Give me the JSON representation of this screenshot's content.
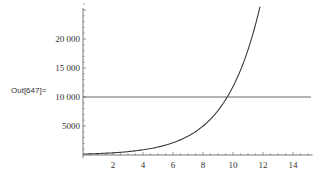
{
  "cell": {
    "output_label": "Out[647]="
  },
  "chart_data": {
    "type": "line",
    "title": "",
    "xlabel": "",
    "ylabel": "",
    "xlim": [
      0,
      15.3
    ],
    "ylim": [
      0,
      25500
    ],
    "grid": false,
    "x_ticks": [
      2,
      4,
      6,
      8,
      10,
      12,
      14
    ],
    "x_tick_labels": [
      "2",
      "4",
      "6",
      "8",
      "10",
      "12",
      "14"
    ],
    "y_ticks": [
      5000,
      10000,
      15000,
      20000
    ],
    "y_tick_labels": [
      "5000",
      "10 000",
      "15 000",
      "20 000"
    ],
    "series": [
      {
        "name": "exponential curve",
        "x": [
          0,
          1,
          2,
          3,
          4,
          5,
          6,
          7,
          8,
          9,
          10,
          11,
          11.8
        ],
        "values": [
          160,
          246,
          378,
          580,
          892,
          1370,
          2110,
          3240,
          4980,
          7650,
          11760,
          18070,
          25500
        ]
      },
      {
        "name": "constant line",
        "x": [
          0,
          15.2
        ],
        "values": [
          10000,
          10000
        ]
      }
    ],
    "annotations": []
  }
}
